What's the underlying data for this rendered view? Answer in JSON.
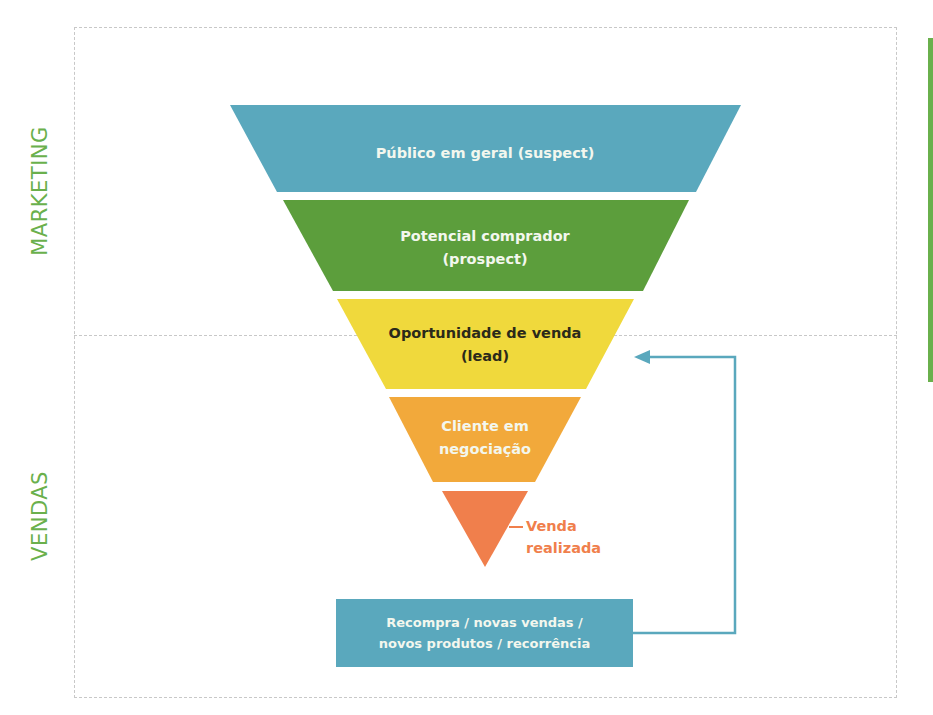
{
  "side_labels": {
    "marketing": "MARKETING",
    "vendas": "VENDAS"
  },
  "colors": {
    "suspect": "#5aa8bd",
    "prospect": "#5c9e3c",
    "lead": "#f0d93c",
    "negociacao": "#f2a93b",
    "venda": "#f07f4c",
    "recompra": "#5aa8bd",
    "side_label": "#6ab04c",
    "connector": "#5aa8bd"
  },
  "funnel": {
    "stages": [
      {
        "id": "suspect",
        "lines": [
          "Público em geral (suspect)"
        ]
      },
      {
        "id": "prospect",
        "lines": [
          "Potencial comprador",
          "(prospect)"
        ]
      },
      {
        "id": "lead",
        "lines": [
          "Oportunidade de venda",
          "(lead)"
        ]
      },
      {
        "id": "negociacao",
        "lines": [
          "Cliente em",
          "negociação"
        ]
      },
      {
        "id": "venda",
        "lines": [
          "Venda",
          "realizada"
        ]
      }
    ]
  },
  "recompra": {
    "lines": [
      "Recompra / novas vendas /",
      "novos produtos / recorrência"
    ]
  }
}
